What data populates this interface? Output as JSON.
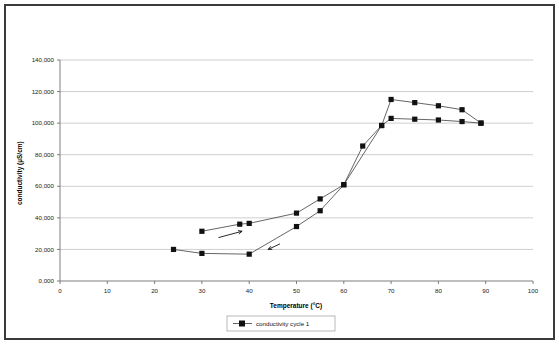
{
  "chart_data": {
    "type": "line",
    "title": "",
    "xlabel": "Temperature (°C)",
    "ylabel": "conductivity (µS/cm)",
    "xlim": [
      0,
      100
    ],
    "ylim": [
      0,
      140000
    ],
    "xticks": [
      "0",
      "10",
      "20",
      "30",
      "40",
      "50",
      "60",
      "70",
      "80",
      "90",
      "100"
    ],
    "xtick_values": [
      0,
      10,
      20,
      30,
      40,
      50,
      60,
      70,
      80,
      90,
      100
    ],
    "yticks": [
      "0,000",
      "20,000",
      "40,000",
      "60,000",
      "80,000",
      "100,000",
      "120,000",
      "140,000"
    ],
    "ytick_values": [
      0,
      20000,
      40000,
      60000,
      80000,
      100000,
      120000,
      140000
    ],
    "grid": "horizontal",
    "legend_position": "bottom-center",
    "legend": [
      "conductivity cycle 1"
    ],
    "marker": "square",
    "marker_color": "#111111",
    "line_color": "#4a4a4a",
    "series": [
      {
        "name": "conductivity cycle 1 - heating branch",
        "points": [
          {
            "x": 24,
            "y": 20000
          },
          {
            "x": 30,
            "y": 17500
          },
          {
            "x": 40,
            "y": 17000
          },
          {
            "x": 50,
            "y": 34500
          },
          {
            "x": 55,
            "y": 44500
          },
          {
            "x": 60,
            "y": 61000
          },
          {
            "x": 64,
            "y": 85500
          },
          {
            "x": 68,
            "y": 98500
          },
          {
            "x": 70,
            "y": 103000
          },
          {
            "x": 75,
            "y": 102500
          },
          {
            "x": 80,
            "y": 102000
          },
          {
            "x": 85,
            "y": 101000
          },
          {
            "x": 89,
            "y": 100000
          }
        ]
      },
      {
        "name": "conductivity cycle 1 - cooling branch",
        "points": [
          {
            "x": 89,
            "y": 100000
          },
          {
            "x": 85,
            "y": 108500
          },
          {
            "x": 80,
            "y": 111000
          },
          {
            "x": 75,
            "y": 113000
          },
          {
            "x": 70,
            "y": 115000
          },
          {
            "x": 68,
            "y": 98500
          },
          {
            "x": 60,
            "y": 61000
          },
          {
            "x": 55,
            "y": 52000
          },
          {
            "x": 50,
            "y": 43000
          },
          {
            "x": 40,
            "y": 36500
          },
          {
            "x": 38,
            "y": 36000
          },
          {
            "x": 30,
            "y": 31500
          }
        ]
      }
    ],
    "annotations": [
      {
        "name": "upper-branch-direction-arrow",
        "from": {
          "x": 33.5,
          "y": 27500
        },
        "to": {
          "x": 38.5,
          "y": 31500
        },
        "direction": "right"
      },
      {
        "name": "lower-branch-direction-arrow",
        "from": {
          "x": 46.5,
          "y": 23500
        },
        "to": {
          "x": 44.0,
          "y": 20000
        },
        "direction": "up-right"
      }
    ]
  }
}
